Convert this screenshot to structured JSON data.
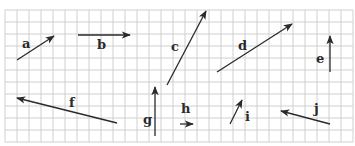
{
  "diagram": {
    "grid": {
      "x0": 5,
      "y0": 10,
      "cell": 12,
      "cols": 29,
      "rows": 11,
      "color": "#d0d0d0"
    },
    "arrow_color": "#2a2a2a",
    "vectors": [
      {
        "label": "a",
        "x1": 17,
        "y1": 60,
        "x2": 54,
        "y2": 36,
        "lx": 22,
        "ly": 48
      },
      {
        "label": "b",
        "x1": 78,
        "y1": 35,
        "x2": 130,
        "y2": 35,
        "lx": 97,
        "ly": 49
      },
      {
        "label": "c",
        "x1": 167,
        "y1": 85,
        "x2": 206,
        "y2": 11,
        "lx": 171,
        "ly": 51
      },
      {
        "label": "d",
        "x1": 217,
        "y1": 72,
        "x2": 292,
        "y2": 24,
        "lx": 238,
        "ly": 50
      },
      {
        "label": "e",
        "x1": 330,
        "y1": 72,
        "x2": 330,
        "y2": 36,
        "lx": 316,
        "ly": 63
      },
      {
        "label": "f",
        "x1": 117,
        "y1": 123,
        "x2": 17,
        "y2": 98,
        "lx": 69,
        "ly": 107
      },
      {
        "label": "g",
        "x1": 155,
        "y1": 136,
        "x2": 155,
        "y2": 87,
        "lx": 143,
        "ly": 124
      },
      {
        "label": "h",
        "x1": 180,
        "y1": 124,
        "x2": 193,
        "y2": 124,
        "lx": 181,
        "ly": 113
      },
      {
        "label": "i",
        "x1": 230,
        "y1": 124,
        "x2": 242,
        "y2": 100,
        "lx": 245,
        "ly": 121
      },
      {
        "label": "j",
        "x1": 330,
        "y1": 124,
        "x2": 281,
        "y2": 111,
        "lx": 314,
        "ly": 113
      }
    ]
  }
}
